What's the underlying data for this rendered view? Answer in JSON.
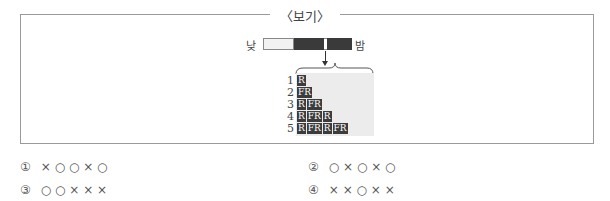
{
  "box": {
    "title": "〈보기〉"
  },
  "bar": {
    "left_label": "낮",
    "right_label": "밤"
  },
  "rows": [
    {
      "num": "1",
      "cells": [
        "R"
      ]
    },
    {
      "num": "2",
      "cells": [
        "FR"
      ]
    },
    {
      "num": "3",
      "cells": [
        "R",
        "FR"
      ]
    },
    {
      "num": "4",
      "cells": [
        "R",
        "FR",
        "R"
      ]
    },
    {
      "num": "5",
      "cells": [
        "R",
        "FR",
        "R",
        "FR"
      ]
    }
  ],
  "choices": [
    {
      "num": "①",
      "text": "× ○ ○ × ○"
    },
    {
      "num": "②",
      "text": "○ × ○ × ○"
    },
    {
      "num": "③",
      "text": "○ ○ × × ×"
    },
    {
      "num": "④",
      "text": "× × ○ × ×"
    }
  ]
}
